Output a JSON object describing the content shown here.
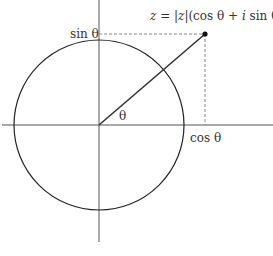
{
  "diagram": {
    "labels": {
      "formula_z": "z",
      "formula_eq": " = |",
      "formula_z2": "z",
      "formula_rest1": "|(cos θ + ",
      "formula_i": "i",
      "formula_rest2": " sin θ)",
      "sin": "sin θ",
      "cos": "cos θ",
      "angle": "θ"
    },
    "geometry": {
      "origin": [
        99,
        125
      ],
      "circle_radius": 85,
      "point": [
        205,
        34
      ]
    },
    "colors": {
      "line": "#333333",
      "axis": "#555555",
      "dashed": "#888888"
    }
  }
}
